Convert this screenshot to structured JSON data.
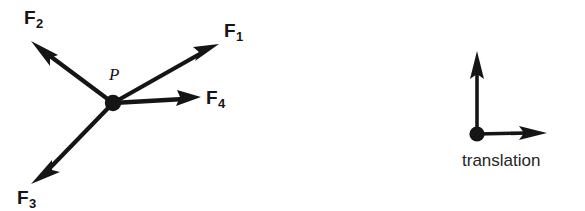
{
  "figure": {
    "background_color": "#ffffff",
    "ink_color": "#151515",
    "width": 585,
    "height": 211
  },
  "force_diagram": {
    "origin_label": "P",
    "origin_point": {
      "x": 113,
      "y": 103
    },
    "vectors": [
      {
        "name": "F1",
        "base": "F",
        "subscript": "1",
        "tip": {
          "x": 218,
          "y": 45
        },
        "label_position": {
          "x": 224,
          "y": 21
        }
      },
      {
        "name": "F2",
        "base": "F",
        "subscript": "2",
        "tip": {
          "x": 32,
          "y": 42
        },
        "label_position": {
          "x": 24,
          "y": 8
        }
      },
      {
        "name": "F3",
        "base": "F",
        "subscript": "3",
        "tip": {
          "x": 32,
          "y": 183
        },
        "label_position": {
          "x": 17,
          "y": 188
        }
      },
      {
        "name": "F4",
        "base": "F",
        "subscript": "4",
        "tip": {
          "x": 200,
          "y": 98
        },
        "label_position": {
          "x": 206,
          "y": 88
        }
      }
    ]
  },
  "translation_diagram": {
    "caption": "translation",
    "origin_point": {
      "x": 477,
      "y": 134
    },
    "arrows": [
      {
        "name": "up-arrow",
        "tip": {
          "x": 477,
          "y": 52
        }
      },
      {
        "name": "right-arrow",
        "tip": {
          "x": 546,
          "y": 133
        }
      }
    ],
    "caption_position": {
      "x": 462,
      "y": 152
    }
  }
}
